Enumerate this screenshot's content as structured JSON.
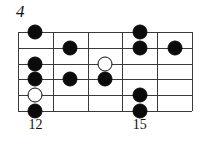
{
  "figure": {
    "number": "4"
  },
  "fretboard": {
    "string_count": 6,
    "fret_count": 5,
    "colors": {
      "line": "#3a3a3a",
      "marker_filled": "#0b0b0b",
      "marker_open_fill": "#ffffff",
      "marker_open_stroke": "#0b0b0b",
      "background": "#ffffff",
      "text": "#111111"
    },
    "fret_labels": [
      {
        "text": "12",
        "fret_index": 0
      },
      {
        "text": "15",
        "fret_index": 3
      }
    ],
    "markers": [
      {
        "fret_index": 0,
        "string_index": 0,
        "type": "filled"
      },
      {
        "fret_index": 0,
        "string_index": 2,
        "type": "filled"
      },
      {
        "fret_index": 0,
        "string_index": 3,
        "type": "filled"
      },
      {
        "fret_index": 0,
        "string_index": 4,
        "type": "open"
      },
      {
        "fret_index": 0,
        "string_index": 5,
        "type": "filled"
      },
      {
        "fret_index": 1,
        "string_index": 1,
        "type": "filled"
      },
      {
        "fret_index": 1,
        "string_index": 3,
        "type": "filled"
      },
      {
        "fret_index": 2,
        "string_index": 2,
        "type": "open"
      },
      {
        "fret_index": 2,
        "string_index": 3,
        "type": "filled"
      },
      {
        "fret_index": 3,
        "string_index": 0,
        "type": "filled"
      },
      {
        "fret_index": 3,
        "string_index": 1,
        "type": "filled"
      },
      {
        "fret_index": 3,
        "string_index": 4,
        "type": "filled"
      },
      {
        "fret_index": 3,
        "string_index": 5,
        "type": "filled"
      },
      {
        "fret_index": 4,
        "string_index": 1,
        "type": "filled"
      }
    ]
  }
}
